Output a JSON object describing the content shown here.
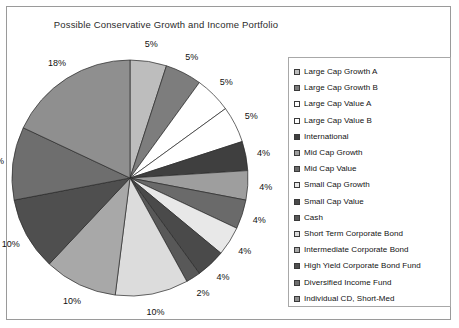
{
  "chart_data": {
    "type": "pie",
    "title": "Possible Conservative Growth and Income Portfolio",
    "xlabel": "",
    "ylabel": "",
    "legend_position": "right",
    "grid": false,
    "start_angle_deg": 0,
    "direction": "clockwise",
    "categories": [
      "Large Cap Growth A",
      "Large Cap Growth B",
      "Large Cap Value A",
      "Large Cap Value B",
      "International",
      "Mid Cap Growth",
      "Mid Cap Value",
      "Small Cap Growth",
      "Small Cap Value",
      "Cash",
      "Short Term Corporate Bond",
      "Intermediate Corporate Bond",
      "High Yield Corporate Bond Fund",
      "Diversified Income Fund",
      "Individual CD, Short-Med"
    ],
    "values": [
      5,
      5,
      5,
      5,
      4,
      4,
      4,
      4,
      4,
      2,
      10,
      10,
      10,
      10,
      18
    ],
    "data_labels": [
      "5%",
      "5%",
      "5%",
      "5%",
      "4%",
      "4%",
      "4%",
      "4%",
      "4%",
      "2%",
      "10%",
      "10%",
      "10%",
      "10%",
      "18%"
    ],
    "colors": [
      "#bdbdbd",
      "#7d7d7d",
      "#ffffff",
      "#ffffff",
      "#3f3f3f",
      "#9e9e9e",
      "#6a6a6a",
      "#e8e8e8",
      "#4a4a4a",
      "#585858",
      "#dcdcdc",
      "#a8a8a8",
      "#4f4f4f",
      "#6e6e6e",
      "#8f8f8f"
    ],
    "total": 100,
    "units": "percent"
  },
  "legend": {
    "items": [
      {
        "label": "Large Cap Growth A",
        "swatch": "#bdbdbd"
      },
      {
        "label": "Large Cap Growth B",
        "swatch": "#7d7d7d"
      },
      {
        "label": "Large Cap Value A",
        "swatch": "#ffffff"
      },
      {
        "label": "Large Cap Value B",
        "swatch": "#ffffff"
      },
      {
        "label": "International",
        "swatch": "#3f3f3f"
      },
      {
        "label": "Mid Cap Growth",
        "swatch": "#9e9e9e"
      },
      {
        "label": "Mid Cap Value",
        "swatch": "#6a6a6a"
      },
      {
        "label": "Small Cap Growth",
        "swatch": "#e8e8e8"
      },
      {
        "label": "Small Cap Value",
        "swatch": "#4a4a4a"
      },
      {
        "label": "Cash",
        "swatch": "#585858"
      },
      {
        "label": "Short Term Corporate Bond",
        "swatch": "#dcdcdc"
      },
      {
        "label": "Intermediate Corporate Bond",
        "swatch": "#a8a8a8"
      },
      {
        "label": "High Yield Corporate Bond Fund",
        "swatch": "#4f4f4f"
      },
      {
        "label": "Diversified Income Fund",
        "swatch": "#6e6e6e"
      },
      {
        "label": "Individual CD, Short-Med",
        "swatch": "#8f8f8f"
      }
    ]
  }
}
